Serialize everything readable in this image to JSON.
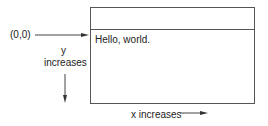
{
  "diagram": {
    "origin_label": "(0,0)",
    "window": {
      "content_text": "Hello, world."
    },
    "y_axis": {
      "label_line1": "y",
      "label_line2": "increases"
    },
    "x_axis": {
      "label": "x increases"
    },
    "colors": {
      "line": "#444444",
      "border": "#555555",
      "text": "#222222"
    }
  }
}
